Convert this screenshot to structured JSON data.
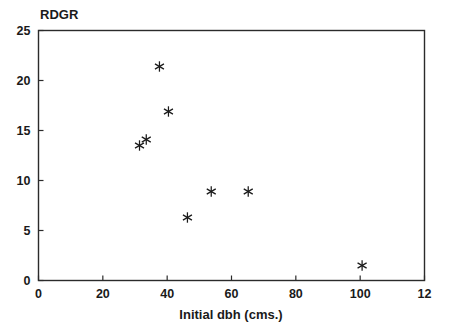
{
  "chart_data": {
    "type": "scatter",
    "title": "",
    "ylabel": "RDGR",
    "xlabel": "Initial dbh (cms.)",
    "xlim": [
      0,
      120
    ],
    "ylim": [
      0,
      25
    ],
    "grid": false,
    "legend": "none",
    "marker": "asterisk",
    "marker_color": "#1a1a1a",
    "xticks": [
      {
        "value": 0,
        "label": "0"
      },
      {
        "value": 20,
        "label": "20"
      },
      {
        "value": 40,
        "label": "40"
      },
      {
        "value": 60,
        "label": "60"
      },
      {
        "value": 80,
        "label": "80"
      },
      {
        "value": 100,
        "label": "100"
      },
      {
        "value": 120,
        "label": "12"
      }
    ],
    "yticks": [
      {
        "value": 0,
        "label": "0"
      },
      {
        "value": 5,
        "label": "5"
      },
      {
        "value": 10,
        "label": "10"
      },
      {
        "value": 15,
        "label": "15"
      },
      {
        "value": 20,
        "label": "20"
      },
      {
        "value": 25,
        "label": "25"
      }
    ],
    "points": [
      {
        "x": 31.4,
        "y": 13.5
      },
      {
        "x": 33.5,
        "y": 14.1
      },
      {
        "x": 37.6,
        "y": 21.4
      },
      {
        "x": 40.4,
        "y": 16.9
      },
      {
        "x": 46.3,
        "y": 6.3
      },
      {
        "x": 53.7,
        "y": 8.9
      },
      {
        "x": 65.2,
        "y": 8.9
      },
      {
        "x": 100.6,
        "y": 1.5
      }
    ]
  },
  "plot": {
    "frame_color": "#2b2b2b",
    "background": "#ffffff"
  }
}
